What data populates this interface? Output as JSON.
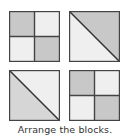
{
  "caption": "Arrange the blocks.",
  "colors": {
    "gray": "#c8c8c8",
    "light": "#efefef",
    "mid_gray": "#d6d6d6",
    "border": "#444444"
  },
  "blocks": [
    {
      "id": 1,
      "type": "four-square",
      "pattern": [
        "gray",
        "light",
        "light",
        "gray"
      ]
    },
    {
      "id": 2,
      "type": "diagonal",
      "upper_right": "gray",
      "lower_left": "light"
    },
    {
      "id": 3,
      "type": "diagonal",
      "upper_right": "light",
      "lower_left": "mid_gray"
    },
    {
      "id": 4,
      "type": "four-square",
      "pattern": [
        "gray",
        "light",
        "light",
        "gray"
      ]
    }
  ]
}
